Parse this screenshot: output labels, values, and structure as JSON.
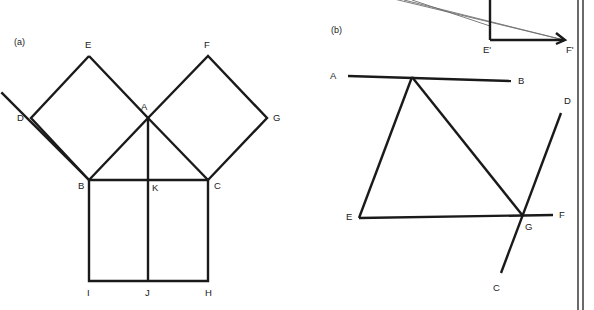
{
  "figure": {
    "background_color": "#ffffff",
    "ink_color": "#1a1a1a",
    "faint_ink_color": "#6e6e6e",
    "panels": [
      {
        "id": "panel-a",
        "label": "(a)",
        "label_x": 14,
        "label_y": 45,
        "description": "Euclid's windmill / Pythagoras figure: right triangle ABC with squares erected on all three sides, plus altitude AK J",
        "points": {
          "A": {
            "x": 148,
            "y": 118,
            "label": "A",
            "label_x": 141,
            "label_y": 110
          },
          "B": {
            "x": 89,
            "y": 180,
            "label": "B",
            "label_x": 78,
            "label_y": 189
          },
          "C": {
            "x": 208,
            "y": 180,
            "label": "C",
            "label_x": 214,
            "label_y": 189
          },
          "D": {
            "x": 31,
            "y": 118,
            "label": "D",
            "label_x": 17,
            "label_y": 121
          },
          "E": {
            "x": 89,
            "y": 56,
            "label": "E",
            "label_x": 85,
            "label_y": 48
          },
          "F": {
            "x": 208,
            "y": 56,
            "label": "F",
            "label_x": 204,
            "label_y": 48
          },
          "G": {
            "x": 267,
            "y": 118,
            "label": "G",
            "label_x": 273,
            "label_y": 121
          },
          "H": {
            "x": 208,
            "y": 281,
            "label": "H",
            "label_x": 205,
            "label_y": 296
          },
          "I": {
            "x": 89,
            "y": 281,
            "label": "I",
            "label_x": 87,
            "label_y": 296
          },
          "J": {
            "x": 148,
            "y": 281,
            "label": "J",
            "label_x": 145,
            "label_y": 296
          },
          "K": {
            "x": 148,
            "y": 180,
            "label": "K",
            "label_x": 152,
            "label_y": 191
          }
        },
        "segments": [
          {
            "name": "square-left-B-E",
            "from": "B",
            "to": "E"
          },
          {
            "name": "square-left-E-A",
            "from": "E",
            "to": "A"
          },
          {
            "name": "square-left-A-B-diagonal",
            "from": "A",
            "to": "B"
          },
          {
            "name": "square-left-B-D",
            "from": "B",
            "to": "D"
          },
          {
            "name": "square-left-D-E",
            "from": "D",
            "to": "E"
          },
          {
            "name": "square-right-A-F",
            "from": "A",
            "to": "F"
          },
          {
            "name": "square-right-F-G",
            "from": "F",
            "to": "G"
          },
          {
            "name": "square-right-G-C",
            "from": "G",
            "to": "C"
          },
          {
            "name": "square-right-C-A-diagonal",
            "from": "C",
            "to": "A"
          },
          {
            "name": "base-B-C",
            "from": "B",
            "to": "C"
          },
          {
            "name": "square-bottom-B-I",
            "from": "B",
            "to": "I"
          },
          {
            "name": "square-bottom-I-H",
            "from": "I",
            "to": "H"
          },
          {
            "name": "square-bottom-H-C",
            "from": "H",
            "to": "C"
          },
          {
            "name": "altitude-A-J",
            "from": "A",
            "to": "J"
          }
        ]
      },
      {
        "id": "panel-b",
        "label": "(b)",
        "label_x": 331,
        "label_y": 33,
        "description": "Hand-drawn construction: line AB, line EF, line CD crossing at G, with a partially visible projected triangle E'F' above",
        "points": {
          "A": {
            "x": 348,
            "y": 76,
            "label": "A",
            "label_x": 330,
            "label_y": 79
          },
          "B": {
            "x": 511,
            "y": 81,
            "label": "B",
            "label_x": 518,
            "label_y": 84
          },
          "C": {
            "x": 501,
            "y": 273,
            "label": "C",
            "label_x": 493,
            "label_y": 291
          },
          "D": {
            "x": 561,
            "y": 113,
            "label": "D",
            "label_x": 564,
            "label_y": 104
          },
          "E": {
            "x": 359,
            "y": 218,
            "label": "E",
            "label_x": 346,
            "label_y": 220
          },
          "F": {
            "x": 553,
            "y": 215,
            "label": "F",
            "label_x": 559,
            "label_y": 218
          },
          "G": {
            "x": 523,
            "y": 216,
            "label": "G",
            "label_x": 525,
            "label_y": 230
          },
          "Vtop": {
            "x": 412,
            "y": 77,
            "label": "",
            "label_x": 0,
            "label_y": 0
          },
          "Eprime": {
            "x": 490,
            "y": 40,
            "label": "E'",
            "label_x": 483,
            "label_y": 53
          },
          "Fprime": {
            "x": 564,
            "y": 40,
            "label": "F'",
            "label_x": 566,
            "label_y": 53
          }
        },
        "segments": [
          {
            "name": "line-A-B",
            "from": "A",
            "to": "B",
            "weight": "main"
          },
          {
            "name": "line-E-F",
            "from": "E",
            "to": "F",
            "weight": "main"
          },
          {
            "name": "line-C-D",
            "from": "C",
            "to": "D",
            "weight": "main"
          },
          {
            "name": "triangle-apex-to-E",
            "from": "Vtop",
            "to": "E",
            "weight": "main"
          },
          {
            "name": "triangle-apex-to-G",
            "from": "Vtop",
            "to": "G",
            "weight": "main"
          },
          {
            "name": "projection-vertical-Eprime",
            "from": "Eprime-top",
            "to": "Eprime",
            "weight": "main"
          },
          {
            "name": "projection-base-Eprime-Fprime",
            "from": "Eprime",
            "to": "Fprime",
            "weight": "main"
          },
          {
            "name": "projection-ray-upper",
            "from": "offscreen-upper",
            "to": "Fprime",
            "weight": "thin"
          },
          {
            "name": "projection-ray-lower",
            "from": "offscreen-lower",
            "to": "Fprime",
            "weight": "thin"
          }
        ]
      }
    ],
    "margin_rules": [
      {
        "name": "margin-rule-inner",
        "x": 578
      },
      {
        "name": "margin-rule-outer",
        "x": 583
      }
    ]
  }
}
